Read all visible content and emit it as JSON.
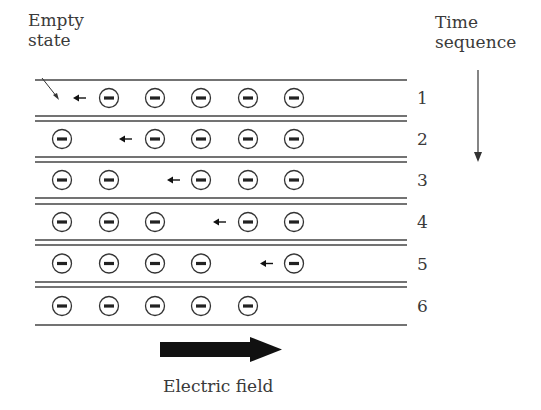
{
  "labels": {
    "empty_state_line1": "Empty",
    "empty_state_line2": "state",
    "time_line1": "Time",
    "time_line2": "sequence",
    "electric_field": "Electric field"
  },
  "rows": [
    {
      "number": "1",
      "electrons": [
        false,
        true,
        true,
        true,
        true,
        true
      ],
      "hole_index": 0,
      "arrow_x": 76
    },
    {
      "number": "2",
      "electrons": [
        true,
        false,
        true,
        true,
        true,
        true
      ],
      "hole_index": 1,
      "arrow_x": 122
    },
    {
      "number": "3",
      "electrons": [
        true,
        true,
        false,
        true,
        true,
        true
      ],
      "hole_index": 2,
      "arrow_x": 170
    },
    {
      "number": "4",
      "electrons": [
        true,
        true,
        true,
        false,
        true,
        true
      ],
      "hole_index": 3,
      "arrow_x": 216
    },
    {
      "number": "5",
      "electrons": [
        true,
        true,
        true,
        true,
        false,
        true
      ],
      "hole_index": 4,
      "arrow_x": 263
    },
    {
      "number": "6",
      "electrons": [
        true,
        true,
        true,
        true,
        true,
        false
      ],
      "hole_index": 5,
      "arrow_x": null
    }
  ],
  "colors": {
    "line": "#444444",
    "text": "#3a3a3a",
    "arrow": "#111111"
  }
}
